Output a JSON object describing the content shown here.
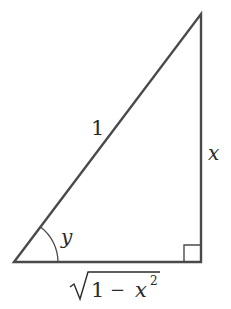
{
  "diagram": {
    "type": "right-triangle",
    "colors": {
      "stroke": "#4a4a4a",
      "text": "#2a2a2a",
      "background": "#ffffff"
    },
    "hypotenuse_label": "1",
    "vertical_leg_label": "x",
    "angle_label": "y",
    "base_label": {
      "number": "1",
      "operator": "−",
      "variable": "x",
      "exponent": "2"
    }
  }
}
